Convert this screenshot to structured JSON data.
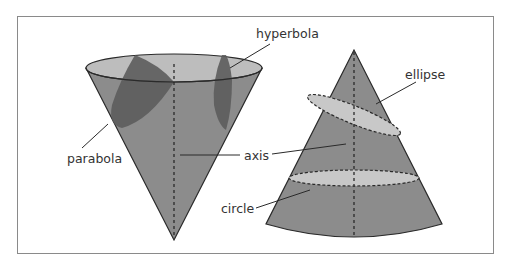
{
  "diagram": {
    "labels": {
      "hyperbola": "hyperbola",
      "parabola": "parabola",
      "axis": "axis",
      "ellipse": "ellipse",
      "circle": "circle"
    },
    "colors": {
      "cone_fill": "#8c8c8c",
      "cone_rim": "#bdbdbd",
      "section_dark": "#5c5c5c",
      "section_light": "#c8c8c8",
      "outline": "#2a2a2a",
      "frame": "#8a8a8a",
      "text": "#333333"
    }
  }
}
